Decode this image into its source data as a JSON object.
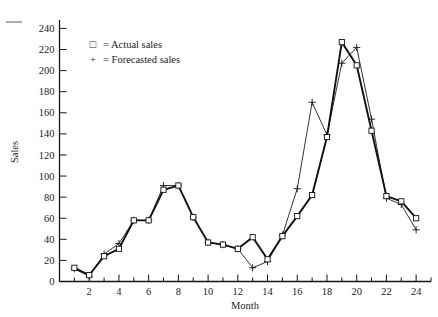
{
  "chart_data": {
    "type": "line",
    "title": "",
    "subtitle": "",
    "xlabel": "Month",
    "ylabel": "Sales",
    "xlim": [
      0,
      25
    ],
    "ylim": [
      0,
      248
    ],
    "grid": false,
    "legend_position": "top-left-inside",
    "x_ticks": [
      2,
      4,
      6,
      8,
      10,
      12,
      14,
      16,
      18,
      20,
      22,
      24
    ],
    "x_minor_ticks": [
      1,
      3,
      5,
      7,
      9,
      11,
      13,
      15,
      17,
      19,
      21,
      23,
      25
    ],
    "y_ticks": [
      0,
      20,
      40,
      60,
      80,
      100,
      120,
      140,
      160,
      180,
      200,
      220,
      240
    ],
    "x": [
      1,
      2,
      3,
      4,
      5,
      6,
      7,
      8,
      9,
      10,
      11,
      12,
      13,
      14,
      15,
      16,
      17,
      18,
      19,
      20,
      21,
      22,
      23,
      24
    ],
    "series": [
      {
        "name": "Actual sales",
        "marker": "square",
        "legend_symbol": "□",
        "legend_label": "= Actual sales",
        "values": [
          13,
          6,
          24,
          31,
          58,
          58,
          87,
          91,
          61,
          37,
          35,
          31,
          42,
          21,
          43,
          62,
          82,
          137,
          227,
          205,
          143,
          81,
          76,
          60
        ]
      },
      {
        "name": "Forecasted sales",
        "marker": "plus",
        "legend_symbol": "+",
        "legend_label": "= Forecasted sales",
        "values": [
          12,
          5,
          26,
          36,
          58,
          58,
          91,
          91,
          61,
          37,
          35,
          31,
          13,
          19,
          44,
          88,
          170,
          139,
          207,
          222,
          154,
          79,
          73,
          49
        ]
      }
    ],
    "annotations": []
  },
  "legend": {
    "entries": [
      {
        "symbol": "□",
        "text": "= Actual sales"
      },
      {
        "symbol": "+",
        "text": "= Forecasted sales"
      }
    ]
  },
  "axes": {
    "y_label": "Sales",
    "x_label": "Month",
    "y_tick_labels": [
      "0",
      "20",
      "40",
      "60",
      "80",
      "100",
      "120",
      "140",
      "160",
      "180",
      "200",
      "220",
      "240"
    ],
    "x_tick_labels": [
      "2",
      "4",
      "6",
      "8",
      "10",
      "12",
      "14",
      "16",
      "18",
      "20",
      "22",
      "24"
    ]
  }
}
